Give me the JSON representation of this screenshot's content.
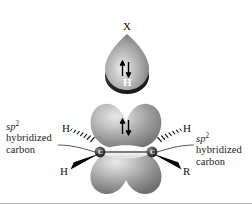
{
  "figure": {
    "background_color": "#ffffff",
    "orbital_light_color": "#9a9a9a",
    "orbital_dark_color": "#2b2b2b",
    "bond_color": "#000000"
  },
  "top_group": {
    "x_label": "X",
    "h_label": "H",
    "spin_pair": "↑↓"
  },
  "alkene": {
    "carbon_left_label": "C",
    "carbon_right_label": "C",
    "pi_spin_pair": "↑↓"
  },
  "substituents": {
    "h_upper_left": "H",
    "h_lower_left": "H",
    "h_upper_right": "H",
    "r_lower_right": "R"
  },
  "annotations": {
    "left": {
      "line1_prefix": "sp",
      "line1_sup": "2",
      "line2": "hybridized",
      "line3": "carbon"
    },
    "right": {
      "line1_prefix": "sp",
      "line1_sup": "2",
      "line2": "hybridized",
      "line3": "carbon"
    }
  }
}
